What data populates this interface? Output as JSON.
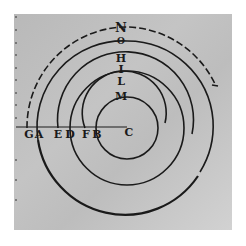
{
  "diagram": {
    "center_label": "C",
    "horizontal_labels": [
      "G",
      "A",
      "E",
      "D",
      "F",
      "B"
    ],
    "vertical_labels": [
      "N",
      "O",
      "H",
      "I",
      "L",
      "M"
    ],
    "colors": {
      "ink": "#1a1a1a",
      "paper": "#c0c0c0",
      "background": "#ffffff"
    },
    "curves": [
      {
        "through": [
          "B",
          "M"
        ],
        "style": "full-circle"
      },
      {
        "through": [
          "F",
          "L"
        ],
        "style": "arc"
      },
      {
        "through": [
          "D",
          "I"
        ],
        "style": "full-circle"
      },
      {
        "through": [
          "E",
          "H"
        ],
        "style": "arc"
      },
      {
        "through": [
          "A",
          "O"
        ],
        "style": "spiral-arc"
      },
      {
        "through": [
          "G",
          "N"
        ],
        "style": "dashed-arc"
      }
    ]
  }
}
